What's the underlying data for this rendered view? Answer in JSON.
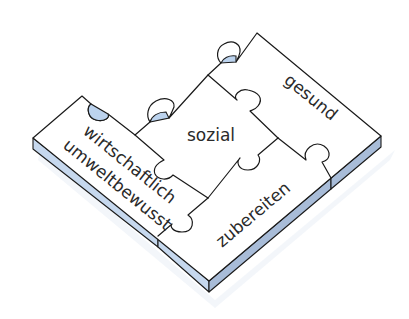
{
  "diagram": {
    "type": "isometric-puzzle",
    "pieces": [
      {
        "id": "sozial",
        "label": "sozial",
        "position": "center"
      },
      {
        "id": "gesund",
        "label": "gesund",
        "position": "top-right"
      },
      {
        "id": "zubereiten",
        "label": "zubereiten",
        "position": "bottom-right"
      },
      {
        "id": "wirtschaftlich-umweltbewusst",
        "label_line1": "wirtschaftlich",
        "label_line2": "umweltbewusst",
        "position": "left"
      }
    ],
    "colors": {
      "top_face": "#ffffff",
      "side_face": "#c6d8ee",
      "outline": "#1a1a1a",
      "text": "#2a2a2a"
    }
  }
}
